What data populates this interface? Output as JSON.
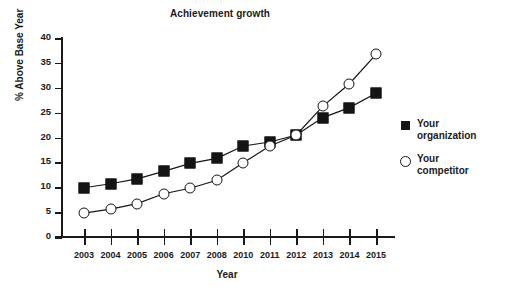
{
  "chart_data": {
    "type": "line",
    "title": "Achievement growth",
    "xlabel": "Year",
    "ylabel": "% Above Base Year",
    "categories": [
      "2003",
      "2004",
      "2005",
      "2006",
      "2007",
      "2008",
      "2010",
      "2011",
      "2012",
      "2013",
      "2014",
      "2015"
    ],
    "series": [
      {
        "name": "Your organization",
        "marker": "filled-square",
        "color": "#141414",
        "values": [
          9.9,
          10.7,
          11.7,
          13.2,
          14.8,
          15.8,
          18.3,
          19.1,
          20.5,
          24.0,
          26.0,
          28.9
        ]
      },
      {
        "name": "Your competitor",
        "marker": "open-circle",
        "color": "#141414",
        "values": [
          4.8,
          5.6,
          6.7,
          8.7,
          9.8,
          11.4,
          14.9,
          18.3,
          20.5,
          26.3,
          30.8,
          36.7
        ]
      }
    ],
    "ylim": [
      0,
      40
    ],
    "yticks": [
      0,
      5,
      10,
      15,
      20,
      25,
      30,
      35,
      40
    ],
    "ytick_labels": [
      "0",
      "5",
      "10",
      "15",
      "20",
      "25",
      "30",
      "35",
      "40"
    ],
    "grid": false,
    "legend_position": "right"
  },
  "legend": {
    "entries": [
      {
        "line1": "Your",
        "line2": "organization",
        "icon": "filled-square-icon"
      },
      {
        "line1": "Your",
        "line2": "competitor",
        "icon": "open-circle-icon"
      }
    ]
  }
}
